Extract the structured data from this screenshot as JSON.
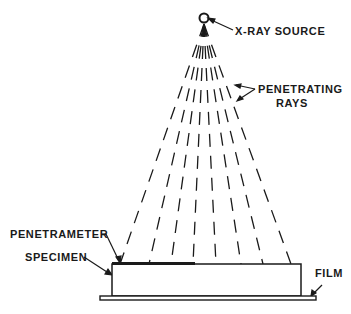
{
  "diagram": {
    "labels": {
      "source": "X-RAY SOURCE",
      "rays_line1": "PENETRATING",
      "rays_line2": "RAYS",
      "penetrameter": "PENETRAMETER",
      "specimen": "SPECIMEN",
      "film": "FILM"
    },
    "geometry": {
      "source": {
        "x": 204,
        "y": 18
      },
      "ray_endpoints_x": [
        120,
        149,
        171,
        193,
        216,
        241,
        263,
        291
      ],
      "ray_end_y": 264,
      "specimen": {
        "x": 112,
        "y": 264,
        "w": 189,
        "h": 32
      },
      "penetrameter": {
        "x": 112,
        "y": 262,
        "w": 83,
        "h": 3
      },
      "film": {
        "x": 100,
        "y": 295,
        "w": 216,
        "h": 5
      }
    },
    "color": "#1a1a1a"
  }
}
